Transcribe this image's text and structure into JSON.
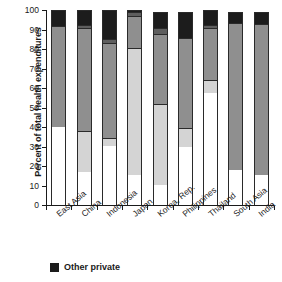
{
  "chart_data": {
    "type": "bar",
    "subtype": "stacked-bar-vertical",
    "title": "",
    "xlabel": "",
    "ylabel": "Percent of total health expenditures",
    "ylim": [
      0,
      100
    ],
    "yticks": [
      0,
      10,
      20,
      30,
      40,
      50,
      60,
      70,
      80,
      90,
      100
    ],
    "ytick_labels": [
      "0",
      "10",
      "20",
      "30",
      "40",
      "50",
      "60",
      "70",
      "80",
      "90",
      "100"
    ],
    "grid": false,
    "legend_position": "below-left",
    "categories": [
      "East Asia",
      "China",
      "Indonesia",
      "Japan",
      "Korea, Rep.",
      "Philippines",
      "Thailand",
      "South Asia",
      "India"
    ],
    "series": [
      {
        "name": "Out-of-pocket",
        "color": "#ffffff",
        "values": [
          40.0,
          16.8,
          30.2,
          15.5,
          10.4,
          30.0,
          57.4,
          18.2,
          15.6
        ]
      },
      {
        "name": "Social security / insurance",
        "color": "#d4d4d4",
        "values": [
          0.0,
          21.2,
          4.1,
          65.0,
          41.2,
          9.6,
          6.6,
          0.0,
          0.0
        ]
      },
      {
        "name": "Public / government",
        "color": "#8f8f8f",
        "values": [
          52.0,
          53.0,
          48.6,
          16.4,
          36.3,
          45.9,
          27.0,
          75.3,
          77.4
        ]
      },
      {
        "name": "Nonprofit",
        "color": "#5e5e5e",
        "values": [
          0.0,
          1.5,
          2.0,
          2.2,
          3.1,
          0.0,
          1.5,
          0.0,
          0.0
        ]
      },
      {
        "name": "Other private",
        "color": "#1c1c1c",
        "values": [
          8.0,
          7.5,
          15.1,
          0.9,
          8.0,
          13.5,
          7.5,
          5.5,
          6.0
        ]
      }
    ],
    "stack_tops": [
      [
        40.0,
        40.0,
        92.0,
        92.0,
        100.0
      ],
      [
        16.8,
        38.0,
        91.0,
        92.5,
        100.0
      ],
      [
        30.2,
        34.3,
        82.9,
        84.9,
        100.0
      ],
      [
        15.5,
        80.5,
        96.9,
        99.1,
        100.0
      ],
      [
        10.4,
        51.6,
        87.9,
        91.0,
        99.0
      ],
      [
        30.0,
        39.6,
        85.5,
        85.5,
        99.0
      ],
      [
        57.4,
        64.0,
        91.0,
        92.5,
        100.0
      ],
      [
        18.2,
        18.2,
        93.5,
        93.5,
        99.0
      ],
      [
        15.6,
        15.6,
        93.0,
        93.0,
        99.0
      ]
    ],
    "annotations": []
  },
  "legend": {
    "entries": [
      {
        "label": "Other private",
        "color": "#1c1c1c",
        "swatch": "filled-square"
      }
    ]
  }
}
